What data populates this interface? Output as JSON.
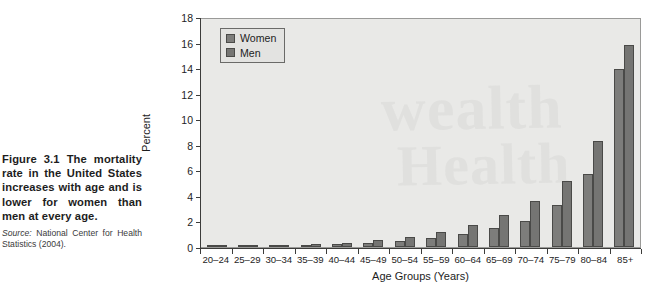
{
  "caption": {
    "figure_number": "Figure 3.1",
    "text": "Figure 3.1   The mortality rate in the United States increases with age and is lower for women than men at every age.",
    "source_label": "Source:",
    "source_text": "National Center for Health Statistics (2004)."
  },
  "watermark": {
    "line1": "wealth",
    "line2": "Health"
  },
  "legend": {
    "items": [
      {
        "label": "Women",
        "color": "#7d7d7b"
      },
      {
        "label": "Men",
        "color": "#757573"
      }
    ]
  },
  "chart_data": {
    "type": "bar",
    "title": "",
    "xlabel": "Age Groups (Years)",
    "ylabel": "Percent",
    "ylim": [
      0,
      18
    ],
    "yticks": [
      0,
      2,
      4,
      6,
      8,
      10,
      12,
      14,
      16,
      18
    ],
    "grid": false,
    "legend_position": "top-left-inside",
    "categories": [
      "20–24",
      "25–29",
      "30–34",
      "35–39",
      "40–44",
      "45–49",
      "50–54",
      "55–59",
      "60–64",
      "65–69",
      "70–74",
      "75–79",
      "80–84",
      "85+"
    ],
    "series": [
      {
        "name": "Women",
        "color": "#7d7d7b",
        "values": [
          0.05,
          0.05,
          0.08,
          0.12,
          0.2,
          0.3,
          0.45,
          0.7,
          1.0,
          1.5,
          2.0,
          3.3,
          5.7,
          13.9
        ]
      },
      {
        "name": "Men",
        "color": "#757573",
        "values": [
          0.12,
          0.13,
          0.16,
          0.22,
          0.35,
          0.55,
          0.8,
          1.2,
          1.7,
          2.5,
          3.6,
          5.2,
          8.3,
          15.8
        ]
      }
    ]
  }
}
